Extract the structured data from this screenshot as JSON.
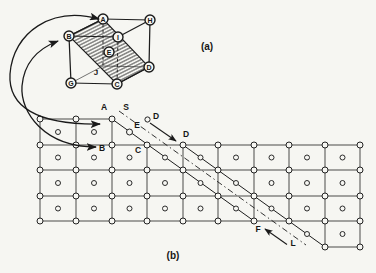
{
  "page": {
    "background": "#f6f6f2",
    "ink": "#1a1a1a"
  },
  "panel_a": {
    "caption": "(a)",
    "caption_pos": {
      "x": 207,
      "y": 50
    },
    "vertices": [
      {
        "label": "A",
        "x": 103,
        "y": 19,
        "circled": true
      },
      {
        "label": "H",
        "x": 150,
        "y": 20,
        "circled": true
      },
      {
        "label": "B",
        "x": 69,
        "y": 36,
        "circled": true
      },
      {
        "label": "I",
        "x": 118,
        "y": 37,
        "circled": true
      },
      {
        "label": "E",
        "x": 109,
        "y": 52,
        "circled": true
      },
      {
        "label": "D",
        "x": 149,
        "y": 67,
        "circled": true
      },
      {
        "label": "G",
        "x": 71,
        "y": 83,
        "circled": true
      },
      {
        "label": "C",
        "x": 117,
        "y": 84,
        "circled": true
      }
    ],
    "hidden_corner": {
      "label": "J",
      "x": 103,
      "y": 66,
      "label_x": 96,
      "label_y": 75
    },
    "circle_radius": 5,
    "edges_solid": [
      [
        "B",
        "A"
      ],
      [
        "A",
        "H"
      ],
      [
        "H",
        "D"
      ],
      [
        "D",
        "C"
      ],
      [
        "C",
        "G"
      ],
      [
        "G",
        "B"
      ],
      [
        "B",
        "I"
      ],
      [
        "I",
        "H"
      ]
    ],
    "edges_dashed": [
      [
        "A",
        "Jc"
      ],
      [
        "I",
        "C"
      ]
    ],
    "edges_thin": [
      [
        "G",
        "Jc"
      ],
      [
        "Jc",
        "D"
      ]
    ],
    "hatch_plane": [
      "B",
      "A",
      "D",
      "C"
    ]
  },
  "panel_b": {
    "caption": "(b)",
    "caption_pos": {
      "x": 173,
      "y": 259
    },
    "hlines": [
      {
        "y": 119,
        "x1": 40,
        "x2": 112
      },
      {
        "y": 145,
        "x1": 40,
        "x2": 360
      },
      {
        "y": 170,
        "x1": 40,
        "x2": 360
      },
      {
        "y": 196,
        "x1": 40,
        "x2": 360
      },
      {
        "y": 221,
        "x1": 40,
        "x2": 360
      },
      {
        "y": 247,
        "x1": 325,
        "x2": 360
      }
    ],
    "vlines": [
      {
        "x": 40,
        "y1": 119,
        "y2": 221
      },
      {
        "x": 76,
        "y1": 119,
        "y2": 221
      },
      {
        "x": 112,
        "y1": 119,
        "y2": 221
      },
      {
        "x": 147,
        "y1": 145,
        "y2": 221
      },
      {
        "x": 183,
        "y1": 145,
        "y2": 221
      },
      {
        "x": 218,
        "y1": 145,
        "y2": 221
      },
      {
        "x": 254,
        "y1": 145,
        "y2": 221
      },
      {
        "x": 289,
        "y1": 145,
        "y2": 221
      },
      {
        "x": 325,
        "y1": 145,
        "y2": 247
      },
      {
        "x": 360,
        "y1": 145,
        "y2": 247
      }
    ],
    "corner_atom_rows": [
      {
        "y": 119,
        "xs": [
          40,
          76,
          112
        ]
      },
      {
        "y": 145,
        "xs": [
          40,
          76,
          112,
          147,
          183,
          218,
          254,
          289,
          325,
          360
        ]
      },
      {
        "y": 170,
        "xs": [
          40,
          76,
          112,
          147,
          183,
          218,
          254,
          289,
          325,
          360
        ]
      },
      {
        "y": 196,
        "xs": [
          40,
          76,
          112,
          147,
          183,
          218,
          254,
          289,
          325,
          360
        ]
      },
      {
        "y": 221,
        "xs": [
          40,
          76,
          112,
          147,
          183,
          218,
          254,
          289,
          325,
          360
        ]
      },
      {
        "y": 247,
        "xs": [
          325,
          360
        ]
      }
    ],
    "center_atom_rows": [
      {
        "y": 132,
        "xs": [
          58,
          94
        ]
      },
      {
        "y": 157.5,
        "xs": [
          58,
          94,
          129.5,
          165,
          200.5,
          236,
          271.5,
          307,
          342.5
        ]
      },
      {
        "y": 183,
        "xs": [
          58,
          94,
          129.5,
          165,
          200.5,
          236,
          271.5,
          307,
          342.5
        ]
      },
      {
        "y": 208.5,
        "xs": [
          58,
          94,
          129.5,
          165,
          200.5,
          236,
          271.5,
          307,
          342.5
        ]
      },
      {
        "y": 234,
        "xs": [
          307,
          342.5
        ]
      }
    ],
    "floating_atoms": [
      {
        "id": "atom-E",
        "x": 129.5,
        "y": 132,
        "r": 3
      },
      {
        "id": "atom-D-upper",
        "x": 147.5,
        "y": 119.5,
        "r": 2.6
      }
    ],
    "corner_atom_radius": 3,
    "center_atom_radius": 2.5,
    "slip_boundary_1": {
      "x1": 112,
      "y1": 119,
      "x2": 254,
      "y2": 221
    },
    "slip_boundary_2": {
      "x1": 183,
      "y1": 145,
      "x2": 325,
      "y2": 247
    },
    "slip_trace": {
      "x1": 119,
      "y1": 111,
      "x2": 306,
      "y2": 245
    },
    "shear_arrows": [
      {
        "id": "slip-arrow-D",
        "x1": 150,
        "y1": 123,
        "x2": 176,
        "y2": 141
      },
      {
        "id": "slip-arrow-L",
        "x1": 287,
        "y1": 244.5,
        "x2": 265,
        "y2": 229
      }
    ],
    "labels": [
      {
        "text": "A",
        "x": 104,
        "y": 110
      },
      {
        "text": "S",
        "x": 126,
        "y": 110
      },
      {
        "text": "D",
        "x": 156,
        "y": 119
      },
      {
        "text": "E",
        "x": 137,
        "y": 128
      },
      {
        "text": "D",
        "x": 186,
        "y": 137
      },
      {
        "text": "B",
        "x": 102,
        "y": 151
      },
      {
        "text": "C",
        "x": 138,
        "y": 153
      },
      {
        "text": "F",
        "x": 258,
        "y": 232
      },
      {
        "text": "L",
        "x": 293,
        "y": 246
      }
    ]
  },
  "connector_arcs": [
    {
      "id": "connector-arc-A",
      "path": "M 99 19 C 52 6, 13 32, 10 74 C 8 106, 36 125, 100 124"
    },
    {
      "id": "connector-arc-B",
      "path": "M 58 41 C 37 49, 24 63, 22 86 C 20 112, 44 147, 96 147"
    }
  ]
}
